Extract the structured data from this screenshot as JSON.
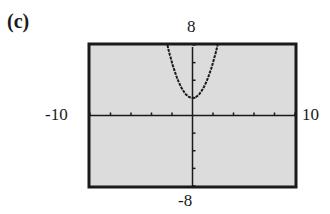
{
  "panel_label": "(c)",
  "window": {
    "xmin": "-10",
    "xmax": "10",
    "ymin": "-8",
    "ymax": "8"
  },
  "chart_data": {
    "type": "line",
    "title": "(c)",
    "function": "y = x^2 + 2",
    "x_range": [
      -10,
      10
    ],
    "y_range": [
      -8,
      8
    ],
    "x_tick_spacing": 2,
    "y_tick_spacing": 2,
    "vertex": [
      0,
      2
    ],
    "points": [
      [
        -2.45,
        8
      ],
      [
        -2,
        6
      ],
      [
        -1,
        3
      ],
      [
        0,
        2
      ],
      [
        1,
        3
      ],
      [
        2,
        6
      ],
      [
        2.45,
        8
      ]
    ],
    "background": "#dcdcdc",
    "grid": false
  }
}
